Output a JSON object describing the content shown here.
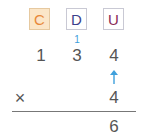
{
  "headers": [
    {
      "label": "C",
      "color": "#e8893a",
      "bg": "#fbe6c8"
    },
    {
      "label": "D",
      "color": "#3b3f8c",
      "bg": "#ffffff"
    },
    {
      "label": "U",
      "color": "#8a2a55",
      "bg": "#ffffff"
    }
  ],
  "carry": "1",
  "multiplicand": [
    "1",
    "3",
    "4"
  ],
  "operator": "×",
  "multiplier": "4",
  "result": "6",
  "arrow_color": "#3fa0dc"
}
